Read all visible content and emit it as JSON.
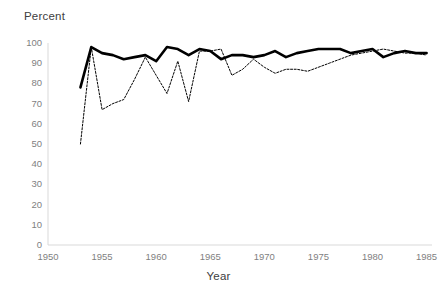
{
  "chart_data": {
    "type": "line",
    "title": "",
    "ylabel": "Percent",
    "xlabel": "Year",
    "xlim": [
      1950,
      1985.5
    ],
    "ylim": [
      0,
      100
    ],
    "ytick_labels": [
      "0",
      "10",
      "20",
      "30",
      "40",
      "50",
      "60",
      "70",
      "80",
      "90",
      "100"
    ],
    "ytick_values": [
      0,
      10,
      20,
      30,
      40,
      50,
      60,
      70,
      80,
      90,
      100
    ],
    "xtick_labels": [
      "1950",
      "1955",
      "1960",
      "1965",
      "1970",
      "1975",
      "1980",
      "1985"
    ],
    "xtick_values": [
      1950,
      1955,
      1960,
      1965,
      1970,
      1975,
      1980,
      1985
    ],
    "grid": false,
    "legend": "none",
    "series": [
      {
        "name": "solid-series",
        "style": "solid",
        "color": "#000000",
        "width": 2.6,
        "x": [
          1953,
          1954,
          1955,
          1956,
          1957,
          1958,
          1959,
          1960,
          1961,
          1962,
          1963,
          1964,
          1965,
          1966,
          1967,
          1968,
          1969,
          1970,
          1971,
          1972,
          1973,
          1974,
          1975,
          1976,
          1977,
          1978,
          1979,
          1980,
          1981,
          1982,
          1983,
          1984,
          1985
        ],
        "values": [
          78,
          98,
          95,
          94,
          92,
          93,
          94,
          91,
          98,
          97,
          94,
          97,
          96,
          92,
          94,
          94,
          93,
          94,
          96,
          93,
          95,
          96,
          97,
          97,
          97,
          95,
          96,
          97,
          93,
          95,
          96,
          95,
          95
        ]
      },
      {
        "name": "dotted-series",
        "style": "dotted",
        "color": "#000000",
        "width": 1.0,
        "x": [
          1953,
          1954,
          1955,
          1956,
          1957,
          1958,
          1959,
          1960,
          1961,
          1962,
          1963,
          1964,
          1965,
          1966,
          1967,
          1968,
          1969,
          1970,
          1971,
          1972,
          1973,
          1974,
          1975,
          1976,
          1977,
          1978,
          1979,
          1980,
          1981,
          1982,
          1983,
          1984,
          1985
        ],
        "values": [
          50,
          98,
          67,
          70,
          72,
          82,
          93,
          84,
          75,
          91,
          71,
          96,
          96,
          97,
          84,
          87,
          92,
          88,
          85,
          87,
          87,
          86,
          88,
          90,
          92,
          94,
          95,
          96,
          97,
          96,
          95,
          95,
          94
        ]
      }
    ]
  },
  "axes": {
    "y_title": "Percent",
    "x_title": "Year"
  }
}
